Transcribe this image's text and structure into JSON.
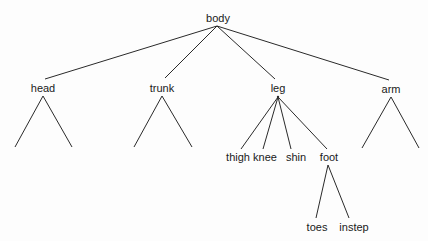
{
  "diagram": {
    "type": "tree",
    "root": "body",
    "nodes": {
      "body": {
        "label": "body",
        "x": 218,
        "y": 18
      },
      "head": {
        "label": "head",
        "x": 43,
        "y": 88
      },
      "trunk": {
        "label": "trunk",
        "x": 162,
        "y": 88
      },
      "leg": {
        "label": "leg",
        "x": 278,
        "y": 88
      },
      "arm": {
        "label": "arm",
        "x": 391,
        "y": 89
      },
      "thigh": {
        "label": "thigh",
        "x": 238,
        "y": 157
      },
      "knee": {
        "label": "knee",
        "x": 265,
        "y": 157
      },
      "shin": {
        "label": "shin",
        "x": 296,
        "y": 157
      },
      "foot": {
        "label": "foot",
        "x": 329,
        "y": 157
      },
      "toes": {
        "label": "toes",
        "x": 317,
        "y": 227
      },
      "instep": {
        "label": "instep",
        "x": 354,
        "y": 227
      }
    },
    "edges": [
      {
        "from": "body",
        "to": "head",
        "x1": 217,
        "y1": 26,
        "x2": 45,
        "y2": 79
      },
      {
        "from": "body",
        "to": "trunk",
        "x1": 217,
        "y1": 26,
        "x2": 165,
        "y2": 78
      },
      {
        "from": "body",
        "to": "leg",
        "x1": 217,
        "y1": 26,
        "x2": 275,
        "y2": 79
      },
      {
        "from": "body",
        "to": "arm",
        "x1": 217,
        "y1": 26,
        "x2": 389,
        "y2": 80
      },
      {
        "from": "head",
        "to": "unlabeled-1",
        "x1": 43,
        "y1": 96,
        "x2": 15,
        "y2": 147
      },
      {
        "from": "head",
        "to": "unlabeled-2",
        "x1": 43,
        "y1": 96,
        "x2": 72,
        "y2": 147
      },
      {
        "from": "trunk",
        "to": "unlabeled-3",
        "x1": 162,
        "y1": 96,
        "x2": 134,
        "y2": 147
      },
      {
        "from": "trunk",
        "to": "unlabeled-4",
        "x1": 162,
        "y1": 96,
        "x2": 192,
        "y2": 147
      },
      {
        "from": "leg",
        "to": "thigh",
        "x1": 278,
        "y1": 97,
        "x2": 241,
        "y2": 149
      },
      {
        "from": "leg",
        "to": "knee",
        "x1": 278,
        "y1": 97,
        "x2": 263,
        "y2": 149
      },
      {
        "from": "leg",
        "to": "shin",
        "x1": 278,
        "y1": 97,
        "x2": 291,
        "y2": 149
      },
      {
        "from": "leg",
        "to": "foot",
        "x1": 278,
        "y1": 97,
        "x2": 327,
        "y2": 149
      },
      {
        "from": "arm",
        "to": "unlabeled-5",
        "x1": 391,
        "y1": 97,
        "x2": 362,
        "y2": 148
      },
      {
        "from": "arm",
        "to": "unlabeled-6",
        "x1": 391,
        "y1": 97,
        "x2": 419,
        "y2": 148
      },
      {
        "from": "foot",
        "to": "toes",
        "x1": 328,
        "y1": 165,
        "x2": 316,
        "y2": 218
      },
      {
        "from": "foot",
        "to": "instep",
        "x1": 328,
        "y1": 165,
        "x2": 349,
        "y2": 218
      }
    ],
    "colors": {
      "line": "#2a2a2a",
      "text": "#1a1a1a",
      "background": "#fdfdfd"
    }
  }
}
